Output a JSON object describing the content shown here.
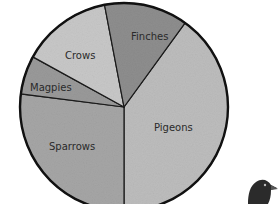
{
  "chart_data": {
    "type": "pie",
    "title": "",
    "categories": [
      "Pigeons",
      "Sparrows",
      "Magpies",
      "Crows",
      "Finches"
    ],
    "values": [
      40,
      27,
      6,
      14,
      13
    ],
    "unit": "%",
    "colors": [
      "#bdbdbd",
      "#a6a6a6",
      "#9a9a9a",
      "#c8c8c8",
      "#8e8e8e"
    ],
    "start_angle_deg": 36,
    "direction": "clockwise",
    "legend": "none (labels inside slices)",
    "center": [
      124,
      107
    ],
    "radius": 104
  },
  "labels": {
    "pigeons": "Pigeons",
    "sparrows": "Sparrows",
    "magpies": "Magpies",
    "crows": "Crows",
    "finches": "Finches"
  },
  "decoration": {
    "bird": "pigeon-illustration"
  }
}
